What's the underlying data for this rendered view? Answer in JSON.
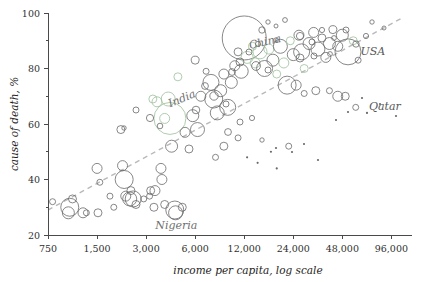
{
  "chart_data": {
    "type": "scatter",
    "title": "",
    "subtitle": "",
    "xlabel": "income per capita, log scale",
    "ylabel": "cause of death, %",
    "xscale": "log",
    "xticks": [
      "750",
      "1,500",
      "3,000",
      "6,000",
      "12,000",
      "24,000",
      "48,000",
      "96,000"
    ],
    "xtick_values": [
      750,
      1500,
      3000,
      6000,
      12000,
      24000,
      48000,
      96000
    ],
    "yticks": [
      "20",
      "40",
      "60",
      "80",
      "100"
    ],
    "ytick_values": [
      20,
      40,
      60,
      80,
      100
    ],
    "xlim": [
      750,
      96000
    ],
    "ylim": [
      20,
      100
    ],
    "grid": false,
    "legend": "none",
    "trendline": {
      "label": "",
      "style": "dashed",
      "color": "#b9b9b9",
      "x_start": 750,
      "y_start": 29,
      "x_end": 110000,
      "y_end": 98
    },
    "annotations": [
      {
        "text": "China",
        "x": 13000,
        "y": 87,
        "color": "#8a8a8a"
      },
      {
        "text": "India",
        "x": 4200,
        "y": 66,
        "color": "#8a8a8a"
      },
      {
        "text": "USA",
        "x": 62000,
        "y": 85,
        "color": "#585858"
      },
      {
        "text": "Qatar",
        "x": 70000,
        "y": 65,
        "color": "#585858"
      },
      {
        "text": "Nigeria",
        "x": 4600,
        "y": 22,
        "color": "#8a8a8a"
      }
    ],
    "series": [
      {
        "name": "countries",
        "encoding": "bubble size = population",
        "points": [
          {
            "x": 1020,
            "y": 30,
            "r": 9
          },
          {
            "x": 1000,
            "y": 28,
            "r": 6
          },
          {
            "x": 1230,
            "y": 28,
            "r": 5
          },
          {
            "x": 1290,
            "y": 28,
            "r": 3
          },
          {
            "x": 1060,
            "y": 33,
            "r": 4
          },
          {
            "x": 800,
            "y": 32,
            "r": 3
          },
          {
            "x": 1500,
            "y": 44,
            "r": 5
          },
          {
            "x": 1520,
            "y": 28,
            "r": 4
          },
          {
            "x": 1560,
            "y": 39,
            "r": 3
          },
          {
            "x": 1800,
            "y": 34,
            "r": 3
          },
          {
            "x": 1900,
            "y": 30,
            "r": 3
          },
          {
            "x": 2150,
            "y": 45,
            "r": 5
          },
          {
            "x": 2200,
            "y": 40,
            "r": 9
          },
          {
            "x": 2250,
            "y": 34,
            "r": 5
          },
          {
            "x": 2380,
            "y": 33,
            "r": 7
          },
          {
            "x": 2420,
            "y": 36,
            "r": 4
          },
          {
            "x": 2500,
            "y": 33,
            "r": 8
          },
          {
            "x": 2600,
            "y": 31,
            "r": 4
          },
          {
            "x": 2100,
            "y": 58,
            "r": 4
          },
          {
            "x": 2900,
            "y": 33,
            "r": 3
          },
          {
            "x": 3150,
            "y": 34,
            "r": 3
          },
          {
            "x": 3200,
            "y": 36,
            "r": 4
          },
          {
            "x": 3400,
            "y": 36,
            "r": 5
          },
          {
            "x": 3350,
            "y": 30,
            "r": 4
          },
          {
            "x": 3700,
            "y": 44,
            "r": 5
          },
          {
            "x": 3750,
            "y": 40,
            "r": 5
          },
          {
            "x": 3900,
            "y": 31,
            "r": 4
          },
          {
            "x": 4300,
            "y": 52,
            "r": 6
          },
          {
            "x": 4500,
            "y": 29,
            "r": 9
          },
          {
            "x": 4550,
            "y": 28,
            "r": 7
          },
          {
            "x": 5000,
            "y": 30,
            "r": 4
          },
          {
            "x": 4200,
            "y": 62,
            "r": 16
          },
          {
            "x": 4100,
            "y": 69,
            "r": 7
          },
          {
            "x": 3500,
            "y": 68,
            "r": 5
          },
          {
            "x": 3300,
            "y": 69,
            "r": 4
          },
          {
            "x": 3900,
            "y": 62,
            "r": 5
          },
          {
            "x": 4700,
            "y": 77,
            "r": 4
          },
          {
            "x": 5200,
            "y": 57,
            "r": 5
          },
          {
            "x": 5500,
            "y": 51,
            "r": 4
          },
          {
            "x": 5800,
            "y": 63,
            "r": 6
          },
          {
            "x": 6200,
            "y": 58,
            "r": 7
          },
          {
            "x": 6500,
            "y": 70,
            "r": 5
          },
          {
            "x": 6000,
            "y": 83,
            "r": 4
          },
          {
            "x": 7000,
            "y": 79,
            "r": 3
          },
          {
            "x": 7500,
            "y": 75,
            "r": 8
          },
          {
            "x": 7800,
            "y": 69,
            "r": 9
          },
          {
            "x": 8200,
            "y": 64,
            "r": 7
          },
          {
            "x": 8600,
            "y": 72,
            "r": 6
          },
          {
            "x": 9000,
            "y": 78,
            "r": 5
          },
          {
            "x": 9500,
            "y": 66,
            "r": 8
          },
          {
            "x": 10000,
            "y": 75,
            "r": 6
          },
          {
            "x": 10500,
            "y": 81,
            "r": 5
          },
          {
            "x": 11000,
            "y": 86,
            "r": 4
          },
          {
            "x": 11500,
            "y": 79,
            "r": 7
          },
          {
            "x": 12000,
            "y": 91,
            "r": 22
          },
          {
            "x": 12500,
            "y": 84,
            "r": 6
          },
          {
            "x": 13500,
            "y": 88,
            "r": 4
          },
          {
            "x": 14000,
            "y": 82,
            "r": 5
          },
          {
            "x": 15000,
            "y": 86,
            "r": 7
          },
          {
            "x": 16000,
            "y": 80,
            "r": 8
          },
          {
            "x": 17000,
            "y": 87,
            "r": 5
          },
          {
            "x": 18000,
            "y": 83,
            "r": 6
          },
          {
            "x": 19000,
            "y": 78,
            "r": 4
          },
          {
            "x": 20000,
            "y": 88,
            "r": 7
          },
          {
            "x": 21000,
            "y": 82,
            "r": 5
          },
          {
            "x": 22000,
            "y": 74,
            "r": 9
          },
          {
            "x": 23000,
            "y": 90,
            "r": 4
          },
          {
            "x": 24000,
            "y": 85,
            "r": 6
          },
          {
            "x": 26000,
            "y": 92,
            "r": 5
          },
          {
            "x": 27000,
            "y": 86,
            "r": 8
          },
          {
            "x": 28000,
            "y": 80,
            "r": 4
          },
          {
            "x": 30000,
            "y": 89,
            "r": 6
          },
          {
            "x": 32000,
            "y": 93,
            "r": 5
          },
          {
            "x": 34000,
            "y": 87,
            "r": 7
          },
          {
            "x": 36000,
            "y": 91,
            "r": 4
          },
          {
            "x": 38000,
            "y": 84,
            "r": 5
          },
          {
            "x": 40000,
            "y": 89,
            "r": 6
          },
          {
            "x": 42000,
            "y": 94,
            "r": 4
          },
          {
            "x": 45000,
            "y": 88,
            "r": 5
          },
          {
            "x": 48000,
            "y": 92,
            "r": 6
          },
          {
            "x": 52000,
            "y": 86,
            "r": 13
          },
          {
            "x": 56000,
            "y": 90,
            "r": 4
          },
          {
            "x": 60000,
            "y": 83,
            "r": 3
          },
          {
            "x": 50000,
            "y": 70,
            "r": 4
          },
          {
            "x": 58000,
            "y": 66,
            "r": 3
          },
          {
            "x": 68000,
            "y": 64,
            "r": 2
          },
          {
            "x": 45000,
            "y": 70,
            "r": 5
          },
          {
            "x": 40000,
            "y": 72,
            "r": 3
          },
          {
            "x": 33000,
            "y": 72,
            "r": 4
          },
          {
            "x": 28000,
            "y": 71,
            "r": 3
          },
          {
            "x": 25000,
            "y": 74,
            "r": 5
          },
          {
            "x": 22500,
            "y": 52,
            "r": 3
          },
          {
            "x": 17500,
            "y": 50,
            "r": 2
          },
          {
            "x": 14500,
            "y": 46,
            "r": 2
          },
          {
            "x": 12500,
            "y": 48,
            "r": 2
          },
          {
            "x": 19000,
            "y": 44,
            "r": 2
          },
          {
            "x": 11000,
            "y": 55,
            "r": 3
          },
          {
            "x": 9000,
            "y": 52,
            "r": 4
          },
          {
            "x": 8000,
            "y": 48,
            "r": 3
          }
        ]
      }
    ]
  }
}
